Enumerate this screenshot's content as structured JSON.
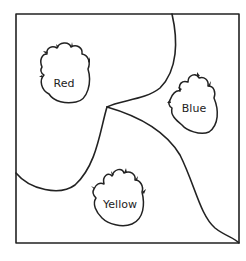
{
  "diagram": {
    "type": "map-regions",
    "colors": {
      "line": "#222222",
      "background": "#ffffff"
    },
    "regions": [
      {
        "id": "red",
        "label": "Red"
      },
      {
        "id": "blue",
        "label": "Blue"
      },
      {
        "id": "yellow",
        "label": "Yellow"
      }
    ],
    "paw_icon": "paw-print-icon"
  }
}
